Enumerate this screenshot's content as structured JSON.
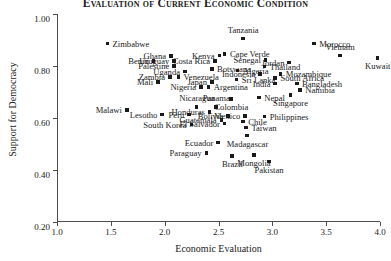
{
  "chart_data": {
    "type": "scatter",
    "title": "Evaluation of Current Economic Condition",
    "xlabel": "Economic Evaluation",
    "ylabel": "Support for Democracy",
    "xlim": [
      1.0,
      4.0
    ],
    "ylim": [
      0.2,
      1.0
    ],
    "xticks": [
      "1.0",
      "1.5",
      "2.0",
      "2.5",
      "3.0",
      "3.5",
      "4.0"
    ],
    "yticks": [
      "0.20",
      "0.40",
      "0.60",
      "0.80",
      "1.00"
    ],
    "grid": false,
    "legend": "none",
    "marker_color": "#1a1a1a",
    "points": [
      {
        "label": "Zimbabwe",
        "x": 1.46,
        "y": 0.885,
        "pos": "r"
      },
      {
        "label": "Tanzania",
        "x": 2.72,
        "y": 0.905,
        "pos": "t"
      },
      {
        "label": "Morocco",
        "x": 3.38,
        "y": 0.885,
        "pos": "r"
      },
      {
        "label": "Vietnam",
        "x": 3.62,
        "y": 0.84,
        "pos": "t"
      },
      {
        "label": "Kuwait",
        "x": 3.97,
        "y": 0.83,
        "pos": "b"
      },
      {
        "label": "Kenya",
        "x": 2.5,
        "y": 0.84,
        "pos": "l"
      },
      {
        "label": "Cape Verde",
        "x": 2.55,
        "y": 0.845,
        "pos": "r"
      },
      {
        "label": "Ghana",
        "x": 2.05,
        "y": 0.838,
        "pos": "l"
      },
      {
        "label": "Uruguay",
        "x": 2.08,
        "y": 0.818,
        "pos": "l"
      },
      {
        "label": "Benin",
        "x": 1.89,
        "y": 0.818,
        "pos": "l"
      },
      {
        "label": "Costa Rica",
        "x": 2.46,
        "y": 0.818,
        "pos": "l"
      },
      {
        "label": "Senegal",
        "x": 2.93,
        "y": 0.822,
        "pos": "l"
      },
      {
        "label": "Jordan",
        "x": 3.15,
        "y": 0.812,
        "pos": "l"
      },
      {
        "label": "Thailand",
        "x": 2.92,
        "y": 0.798,
        "pos": "r"
      },
      {
        "label": "Palestine",
        "x": 2.08,
        "y": 0.8,
        "pos": "l"
      },
      {
        "label": "Botswana",
        "x": 2.43,
        "y": 0.788,
        "pos": "r"
      },
      {
        "label": "Algeria",
        "x": 2.67,
        "y": 0.782,
        "pos": "r"
      },
      {
        "label": "Uganda",
        "x": 2.18,
        "y": 0.778,
        "pos": "l"
      },
      {
        "label": "Indonesia",
        "x": 2.88,
        "y": 0.768,
        "pos": "l"
      },
      {
        "label": "Mozambique",
        "x": 3.07,
        "y": 0.768,
        "pos": "r"
      },
      {
        "label": "Zambia",
        "x": 2.04,
        "y": 0.758,
        "pos": "l"
      },
      {
        "label": "Venezuela",
        "x": 2.12,
        "y": 0.758,
        "pos": "r"
      },
      {
        "label": "South Africa",
        "x": 3.02,
        "y": 0.752,
        "pos": "r"
      },
      {
        "label": "Sri Lanka",
        "x": 2.66,
        "y": 0.748,
        "pos": "r"
      },
      {
        "label": "Japan",
        "x": 2.43,
        "y": 0.738,
        "pos": "l"
      },
      {
        "label": "Mali",
        "x": 1.93,
        "y": 0.738,
        "pos": "l"
      },
      {
        "label": "India",
        "x": 3.02,
        "y": 0.732,
        "pos": "l"
      },
      {
        "label": "Bangladesh",
        "x": 3.22,
        "y": 0.732,
        "pos": "r"
      },
      {
        "label": "Nigeria",
        "x": 2.33,
        "y": 0.718,
        "pos": "l"
      },
      {
        "label": "Argentina",
        "x": 2.4,
        "y": 0.718,
        "pos": "r"
      },
      {
        "label": "Namibia",
        "x": 3.25,
        "y": 0.708,
        "pos": "r"
      },
      {
        "label": "Colombia",
        "x": 2.61,
        "y": 0.672,
        "pos": "b"
      },
      {
        "label": "Nepal",
        "x": 2.87,
        "y": 0.678,
        "pos": "r"
      },
      {
        "label": "Singapore",
        "x": 3.16,
        "y": 0.688,
        "pos": "b"
      },
      {
        "label": "Malawi",
        "x": 1.64,
        "y": 0.63,
        "pos": "l"
      },
      {
        "label": "Nicaragua",
        "x": 2.29,
        "y": 0.642,
        "pos": "t"
      },
      {
        "label": "Panama",
        "x": 2.47,
        "y": 0.642,
        "pos": "t"
      },
      {
        "label": "Honduras",
        "x": 2.41,
        "y": 0.622,
        "pos": "l"
      },
      {
        "label": "Lesotho",
        "x": 1.97,
        "y": 0.612,
        "pos": "l"
      },
      {
        "label": "Peru",
        "x": 2.22,
        "y": 0.612,
        "pos": "l"
      },
      {
        "label": "Bolivia",
        "x": 2.58,
        "y": 0.608,
        "pos": "l"
      },
      {
        "label": "Mexico",
        "x": 2.74,
        "y": 0.608,
        "pos": "l"
      },
      {
        "label": "Philippines",
        "x": 2.92,
        "y": 0.605,
        "pos": "r"
      },
      {
        "label": "Guatemala",
        "x": 2.52,
        "y": 0.592,
        "pos": "l"
      },
      {
        "label": "Chile",
        "x": 2.72,
        "y": 0.585,
        "pos": "r"
      },
      {
        "label": "South Korea",
        "x": 2.24,
        "y": 0.575,
        "pos": "l"
      },
      {
        "label": "El Salvador",
        "x": 2.55,
        "y": 0.578,
        "pos": "l"
      },
      {
        "label": "Taiwan",
        "x": 2.75,
        "y": 0.562,
        "pos": "r"
      },
      {
        "label": "Madagascar",
        "x": 2.76,
        "y": 0.532,
        "pos": "b"
      },
      {
        "label": "Ecuador",
        "x": 2.49,
        "y": 0.505,
        "pos": "l"
      },
      {
        "label": "Paraguay",
        "x": 2.38,
        "y": 0.465,
        "pos": "l"
      },
      {
        "label": "Brazil",
        "x": 2.62,
        "y": 0.452,
        "pos": "b"
      },
      {
        "label": "Mongolia",
        "x": 2.82,
        "y": 0.458,
        "pos": "b"
      },
      {
        "label": "Pakistan",
        "x": 2.96,
        "y": 0.432,
        "pos": "b"
      }
    ]
  }
}
